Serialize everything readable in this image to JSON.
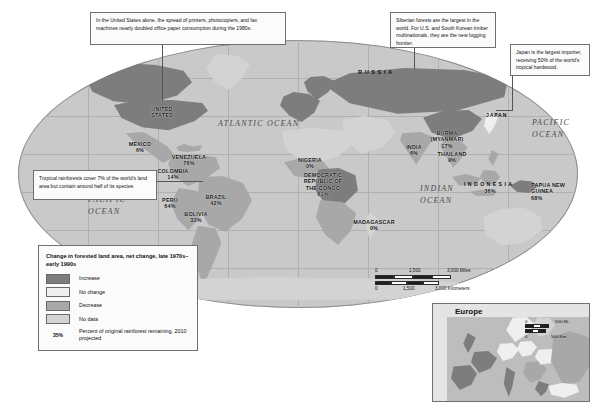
{
  "map": {
    "title_hidden": "",
    "oceans": [
      {
        "name": "ATLANTIC OCEAN",
        "x": 218,
        "y": 124
      },
      {
        "name": "PACIFIC OCEAN",
        "x": 536,
        "y": 122
      },
      {
        "name": "PACIFIC OCEAN",
        "x": 92,
        "y": 200
      },
      {
        "name": "INDIAN OCEAN",
        "x": 424,
        "y": 188
      }
    ],
    "region_labels": [
      {
        "name": "RUSSIA",
        "x": 380,
        "y": 72
      },
      {
        "name": "JAPAN",
        "x": 491,
        "y": 115
      },
      {
        "name": "INDONESIA",
        "x": 489,
        "y": 184
      }
    ],
    "countries": [
      {
        "name": "UNITED STATES",
        "pct": "",
        "x": 161,
        "y": 110
      },
      {
        "name": "MEXICO",
        "pct": "6%",
        "x": 140,
        "y": 145
      },
      {
        "name": "VENEZUELA",
        "pct": "76%",
        "x": 188,
        "y": 158
      },
      {
        "name": "COLOMBIA",
        "pct": "14%",
        "x": 172,
        "y": 172
      },
      {
        "name": "PERU",
        "pct": "64%",
        "x": 170,
        "y": 201
      },
      {
        "name": "BRAZIL",
        "pct": "42%",
        "x": 215,
        "y": 198
      },
      {
        "name": "BOLIVIA",
        "pct": "33%",
        "x": 196,
        "y": 215
      },
      {
        "name": "NIGERIA",
        "pct": "0%",
        "x": 310,
        "y": 161
      },
      {
        "name": "DEMOCRATIC REPUBLIC OF THE CONGO",
        "pct": "61%",
        "x": 323,
        "y": 181
      },
      {
        "name": "MADAGASCAR",
        "pct": "0%",
        "x": 374,
        "y": 223
      },
      {
        "name": "INDIA",
        "pct": "6%",
        "x": 414,
        "y": 148
      },
      {
        "name": "BURMA (MYANMAR)",
        "pct": "17%",
        "x": 447,
        "y": 138
      },
      {
        "name": "THAILAND",
        "pct": "9%",
        "x": 452,
        "y": 155
      },
      {
        "name": "PAPUA NEW GUINEA",
        "pct": "68%",
        "x": 551,
        "y": 190
      },
      {
        "name": "INDONESIA",
        "pct": "36%",
        "x": 489,
        "y": 190
      }
    ]
  },
  "callouts": [
    {
      "id": "usa-paper",
      "text": "In the United States alone, the spread of printers, photocopiers, and fax machines nearly doubled office paper consumption during the 1980s."
    },
    {
      "id": "siberia-logging",
      "text": "Siberian forests are the largest in the world. For U.S. and South Korean timber multinationals, they are the new logging frontier."
    },
    {
      "id": "japan-importer",
      "text": "Japan is the largest importer, receiving 50% of the world's tropical hardwood."
    },
    {
      "id": "rainforest-species",
      "text": "Tropical rainforests cover 7% of the world's land area but contain around half of its species"
    }
  ],
  "legend": {
    "title": "Change in forested land area, net change, late 1970s–early 1990s",
    "items": [
      {
        "label": "Increase",
        "color": "#7d7d7d"
      },
      {
        "label": "No change",
        "color": "#efefef"
      },
      {
        "label": "Decrease",
        "color": "#a8a8a8"
      },
      {
        "label": "No data",
        "color": "#d3d3d3"
      }
    ],
    "pct_key": {
      "value": "35%",
      "label": "Percent of original rainforest remaining, 2010 projected"
    }
  },
  "scale": {
    "miles": {
      "zero": "0",
      "mid": "1,500",
      "max": "3,000 Miles"
    },
    "kilometers": {
      "zero": "0",
      "mid": "1,500",
      "max": "3,000 Kilometers"
    }
  },
  "inset": {
    "title": "Europe",
    "scale": {
      "miles": {
        "zero": "0",
        "max": "500 Mi."
      },
      "kilometers": {
        "zero": "0",
        "max": "500 Km."
      }
    }
  },
  "colors": {
    "increase": "#7d7d7d",
    "no_change": "#efefef",
    "decrease": "#a8a8a8",
    "no_data": "#d3d3d3",
    "ocean": "#c9c9c9",
    "border": "#6f6f6f"
  }
}
